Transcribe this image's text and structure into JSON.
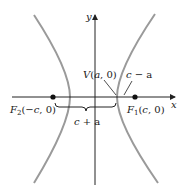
{
  "diagram": {
    "axes": {
      "x_label": "x",
      "y_label": "y"
    },
    "points": {
      "focus_left": {
        "label_main": "F",
        "label_sub": "2",
        "label_coords": "(−c, 0)"
      },
      "focus_right": {
        "label_main": "F",
        "label_sub": "1",
        "label_coords": "(c, 0)"
      },
      "vertex": {
        "label": "V(a, 0)"
      }
    },
    "distances": {
      "c_plus_a": "c + a",
      "c_minus_a": "c − a"
    },
    "colors": {
      "curve": "#9a9a9a",
      "axis": "#222222",
      "text": "#1a1a1a"
    }
  }
}
